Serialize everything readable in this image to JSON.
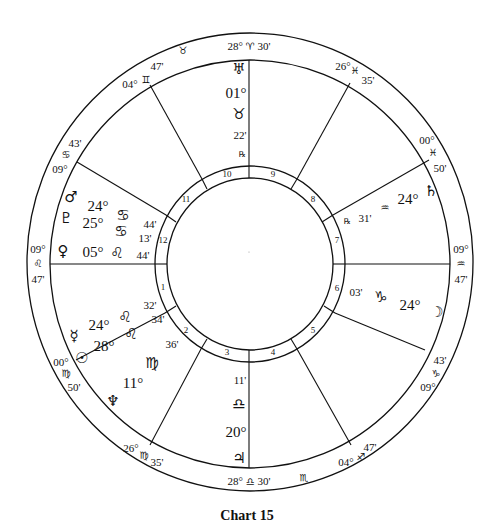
{
  "caption": "Chart 15",
  "cusps": {
    "mc": {
      "deg": "28°",
      "sign": "♈",
      "min": "30'"
    },
    "c11": {
      "deg": "04°",
      "sign": "♊",
      "min": "47'"
    },
    "c12": {
      "deg": "09°",
      "sign": "♋",
      "min": "43'"
    },
    "asc": {
      "deg": "09°",
      "sign": "♌",
      "min": "47'"
    },
    "c2": {
      "deg": "00°",
      "sign": "♍",
      "min": "50'"
    },
    "c3": {
      "deg": "26°",
      "sign": "♍",
      "min": "35'"
    },
    "ic": {
      "deg": "28°",
      "sign": "♎",
      "min": "30'"
    },
    "c5": {
      "deg": "04°",
      "sign": "♐",
      "min": "47'"
    },
    "c6": {
      "deg": "09°",
      "sign": "♑",
      "min": "43'"
    },
    "dsc": {
      "deg": "09°",
      "sign": "♒",
      "min": "47'"
    },
    "c8": {
      "deg": "00°",
      "sign": "♓",
      "min": "50'"
    },
    "c9": {
      "deg": "26°",
      "sign": "♓",
      "min": "35'"
    }
  },
  "intercepted": {
    "top": "♉",
    "bottom": "♏"
  },
  "houses": [
    "1",
    "2",
    "3",
    "4",
    "5",
    "6",
    "7",
    "8",
    "9",
    "10",
    "11",
    "12"
  ],
  "planets": {
    "uranus": {
      "glyph": "♅",
      "deg": "01°",
      "sign": "♉",
      "min": "22'",
      "retro": "℞"
    },
    "saturn": {
      "glyph": "♄",
      "deg": "24°",
      "sign": "♒",
      "min": "31'",
      "retro": "℞"
    },
    "moon": {
      "glyph": "☽",
      "deg": "24°",
      "sign": "♑",
      "min": "03'"
    },
    "jupiter": {
      "glyph": "♃",
      "deg": "20°",
      "sign": "♎",
      "min": "11'"
    },
    "neptune": {
      "glyph": "♆",
      "deg": "11°",
      "sign": "♍",
      "min": "36'"
    },
    "sun": {
      "glyph": "☉",
      "deg": "28°",
      "sign": "♌",
      "min": "34'"
    },
    "mercury": {
      "glyph": "☿",
      "deg": "24°",
      "sign": "♌",
      "min": "32'"
    },
    "venus": {
      "glyph": "♀",
      "deg": "05°",
      "sign": "♌",
      "min": "44'"
    },
    "pluto": {
      "glyph": "♇",
      "deg": "25°",
      "sign": "♋",
      "min": "13'"
    },
    "mars": {
      "glyph": "♂",
      "deg": "24°",
      "sign": "♋",
      "min": "44'"
    }
  }
}
